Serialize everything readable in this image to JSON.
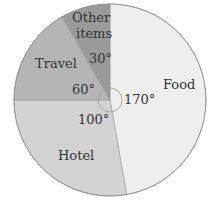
{
  "chart_data": {
    "type": "pie",
    "title": "",
    "unit": "degrees",
    "categories": [
      "Food",
      "Hotel",
      "Travel",
      "Other items"
    ],
    "values": [
      170,
      100,
      60,
      30
    ],
    "value_labels": [
      "170°",
      "100°",
      "60°",
      "30°"
    ],
    "colors": [
      "#eeeeee",
      "#d3d3d3",
      "#b5b5b5",
      "#9a9a9a"
    ],
    "start_angle": "12 o'clock",
    "direction": "clockwise",
    "legend": "none (labels inside slices)"
  },
  "labels": {
    "food": "Food",
    "hotel": "Hotel",
    "travel": "Travel",
    "other_line1": "Other",
    "other_line2": "items",
    "food_angle": "170°",
    "hotel_angle": "100°",
    "travel_angle": "60°",
    "other_angle": "30°"
  }
}
